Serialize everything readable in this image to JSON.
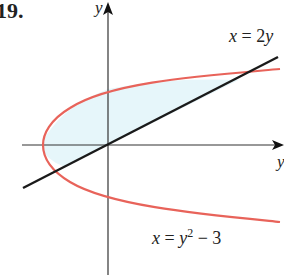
{
  "problem_number": "19.",
  "axes": {
    "x_label": "y",
    "y_label": "y"
  },
  "curves": [
    {
      "name": "line",
      "equation": "x = 2y",
      "color": "#1a1a1a"
    },
    {
      "name": "parabola",
      "equation": "x = y^2 − 3",
      "color": "#e8635a"
    }
  ],
  "labels": {
    "line_eq": {
      "var": "x",
      "eq": " = 2",
      "var2": "y"
    },
    "parabola_eq": {
      "var": "x",
      "eq": " = ",
      "var2": "y",
      "exp": "2",
      "tail": " − 3"
    }
  },
  "region_fill": "#e6f6fa",
  "intersections": [
    [
      -2,
      -1
    ],
    [
      6,
      3
    ]
  ]
}
